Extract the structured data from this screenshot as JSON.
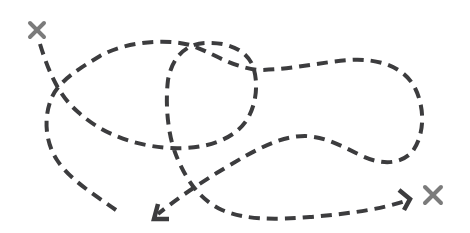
{
  "illustration": {
    "description": "Hand-drawn tangled dashed route between two X marks",
    "colors": {
      "background": "#ffffff",
      "path": "#3c3c3e",
      "marker": "#7b7b7b"
    },
    "markers": [
      {
        "name": "start-x-mark",
        "x": 37,
        "y": 30,
        "size": 7
      },
      {
        "name": "end-x-mark",
        "x": 433,
        "y": 195,
        "size": 8
      }
    ],
    "paths": [
      {
        "name": "route-a",
        "d": "M40,44 C48,70 58,95 78,112 C100,132 130,145 168,148 C205,150 235,140 248,118 C258,100 258,78 252,64 C244,48 225,42 205,43 C185,44 172,58 168,80 C165,105 168,135 176,155 C186,180 200,200 222,210 C245,220 275,220 310,217 C345,214 380,210 408,200",
        "arrow": {
          "tip_x": 410,
          "tip_y": 199,
          "wing1_x": 399,
          "wing1_y": 190,
          "wing2_x": 404,
          "wing2_y": 210
        }
      },
      {
        "name": "route-b",
        "d": "M116,210 C95,195 70,180 57,160 C44,140 44,115 52,97 C60,80 80,68 100,56 C125,42 165,38 190,45 C212,52 228,66 258,70 C290,70 320,62 350,60 C380,58 405,68 415,88 C425,108 425,135 412,152 C400,165 380,165 360,155 C340,145 325,137 305,136 C280,136 255,150 225,168 C200,183 175,200 158,214",
        "arrow": {
          "tip_x": 154,
          "tip_y": 219,
          "wing1_x": 158,
          "wing1_y": 204,
          "wing2_x": 169,
          "wing2_y": 219
        }
      }
    ]
  }
}
